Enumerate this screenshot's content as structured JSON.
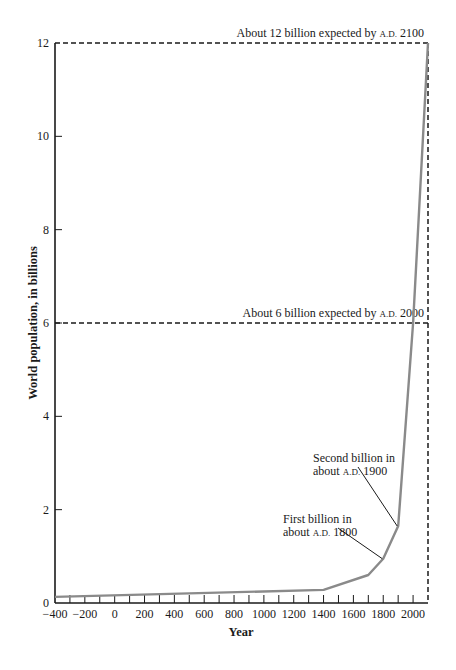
{
  "chart_data": {
    "type": "line",
    "title": "",
    "xlabel": "Year",
    "ylabel": "World population, in billions",
    "xlim": [
      -400,
      2100
    ],
    "ylim": [
      0,
      12
    ],
    "grid": false,
    "legend": null,
    "x_ticks": [
      -400,
      -200,
      0,
      200,
      400,
      600,
      800,
      1000,
      1200,
      1400,
      1600,
      1800,
      2000
    ],
    "x_tick_labels": [
      "−400",
      "−200",
      "0",
      "200",
      "400",
      "600",
      "800",
      "1000",
      "1200",
      "1400",
      "1600",
      "1800",
      "2000"
    ],
    "x_minor_ticks_every": 100,
    "y_ticks": [
      0,
      2,
      4,
      6,
      8,
      10,
      12
    ],
    "y_tick_labels": [
      "0",
      "2",
      "4",
      "6",
      "8",
      "10",
      "12"
    ],
    "series": [
      {
        "name": "World population",
        "color": "#8a8a8a",
        "x": [
          -400,
          1400,
          1700,
          1800,
          1900,
          2000,
          2100
        ],
        "y": [
          0.13,
          0.28,
          0.6,
          0.95,
          1.65,
          6.0,
          12.0
        ]
      }
    ],
    "reference_lines": [
      {
        "type": "horizontal",
        "y": 12,
        "style": "dashed",
        "label_prefix": "About 12 billion expected by",
        "label_era": "A.D.",
        "label_year": "2100"
      },
      {
        "type": "horizontal",
        "y": 6,
        "style": "dashed",
        "label_prefix": "About 6 billion expected by",
        "label_era": "A.D.",
        "label_year": "2000"
      },
      {
        "type": "vertical",
        "x": 2100,
        "style": "dashed"
      }
    ],
    "annotations": [
      {
        "line1": "Second billion in",
        "line2_prefix": "about",
        "era": "A.D.",
        "year": "1900",
        "points_to": [
          1900,
          1.65
        ]
      },
      {
        "line1": "First billion in",
        "line2_prefix": "about",
        "era": "A.D.",
        "year": "1800",
        "points_to": [
          1800,
          0.95
        ]
      }
    ]
  },
  "colors": {
    "curve": "#8a8a8a",
    "axis": "#1a1a1a",
    "text": "#1a1a1a"
  }
}
